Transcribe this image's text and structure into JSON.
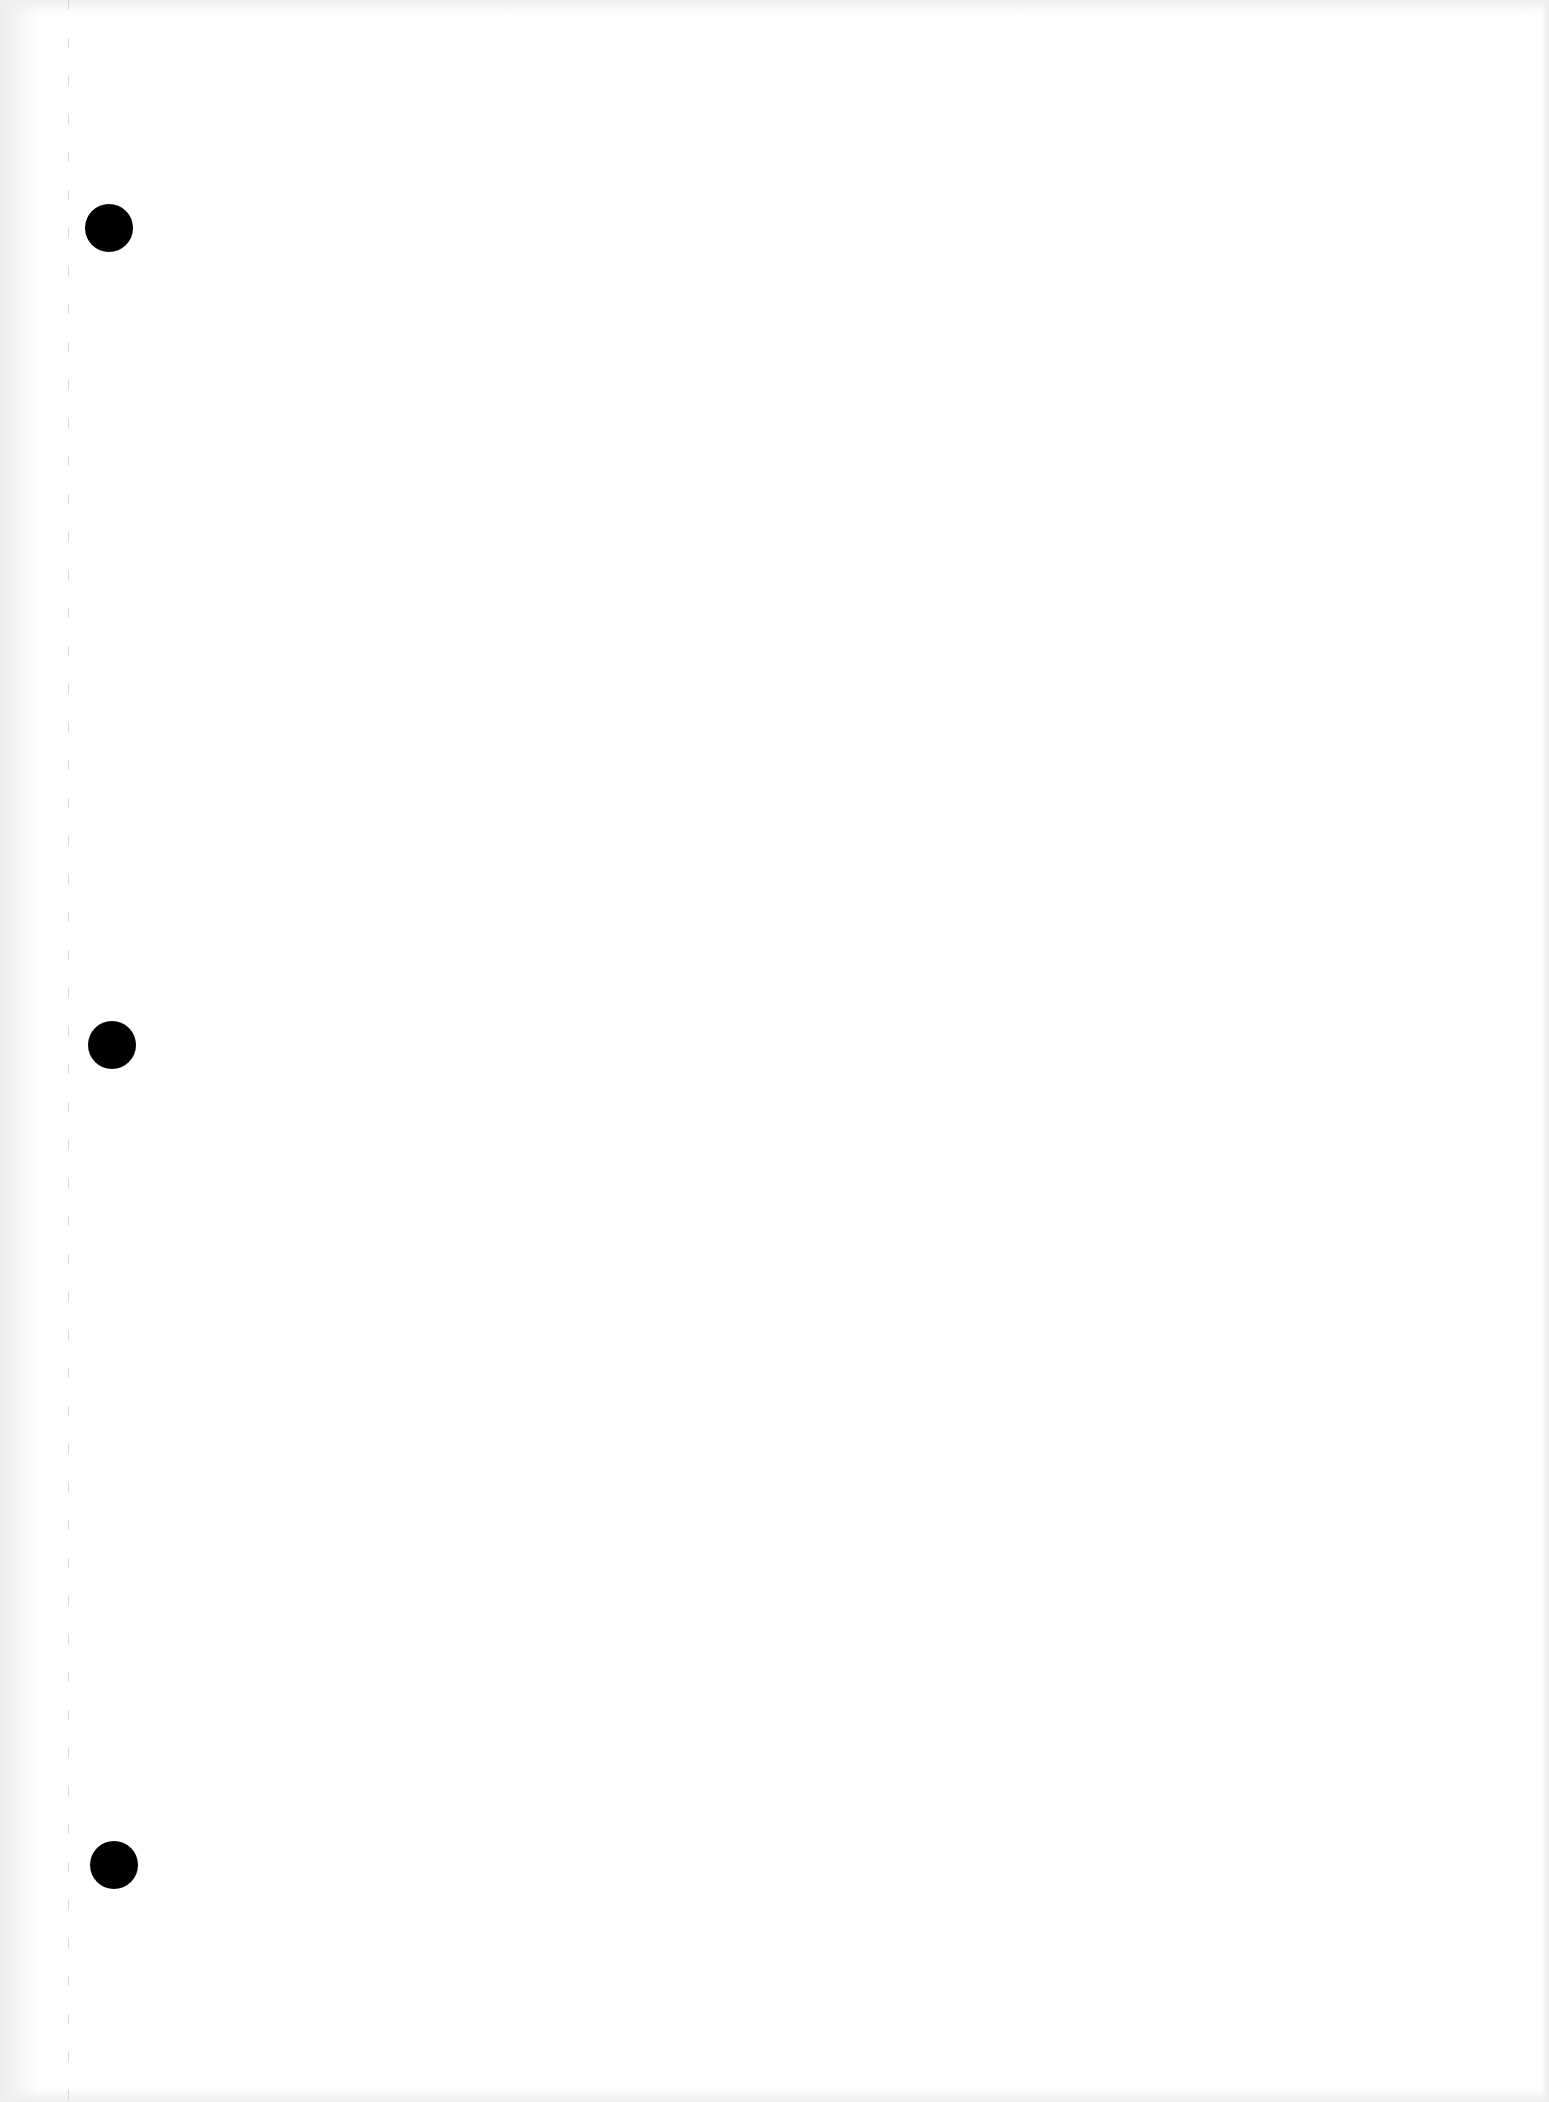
{
  "document": {
    "type": "blank scanned sheet",
    "background_color": "#ffffff",
    "text_content": ""
  },
  "punch_holes": [
    {
      "cx": 109,
      "cy": 228,
      "r": 24,
      "color": "#000000"
    },
    {
      "cx": 112,
      "cy": 1045,
      "r": 24,
      "color": "#000000"
    },
    {
      "cx": 114,
      "cy": 1865,
      "r": 24,
      "color": "#000000"
    }
  ],
  "margin_line": {
    "x": 68,
    "style": "dashed",
    "color": "#c8c8c8"
  }
}
